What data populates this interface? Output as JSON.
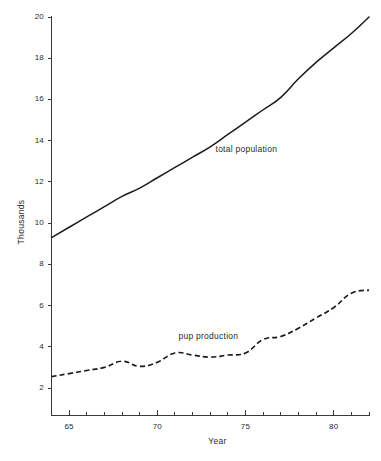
{
  "chart_data": {
    "type": "line",
    "title": "",
    "xlabel": "Year",
    "ylabel": "Thousands",
    "xlim": [
      1964,
      1982
    ],
    "ylim": [
      1.2,
      20
    ],
    "grid": false,
    "legend": "inline annotations",
    "x_tick_labels": [
      "65",
      "70",
      "75",
      "80"
    ],
    "x_tick_values": [
      1965,
      1970,
      1975,
      1980
    ],
    "x_minor_ticks": [
      1964,
      1966,
      1967,
      1968,
      1969,
      1971,
      1972,
      1973,
      1974,
      1976,
      1977,
      1978,
      1979,
      1981,
      1982
    ],
    "y_tick_labels": [
      "2",
      "4",
      "6",
      "8",
      "10",
      "12",
      "14",
      "16",
      "18",
      "20"
    ],
    "y_tick_values": [
      2,
      4,
      6,
      8,
      10,
      12,
      14,
      16,
      18,
      20
    ],
    "x": [
      1964,
      1965,
      1966,
      1967,
      1968,
      1969,
      1970,
      1971,
      1972,
      1973,
      1974,
      1975,
      1976,
      1977,
      1978,
      1979,
      1980,
      1981,
      1982
    ],
    "series": [
      {
        "name": "total population",
        "style": "solid",
        "label": "total population",
        "color": "#1b1b1b",
        "values": [
          9.3,
          9.8,
          10.3,
          10.8,
          11.3,
          11.7,
          12.2,
          12.7,
          13.2,
          13.7,
          14.3,
          14.9,
          15.5,
          16.1,
          17.0,
          17.8,
          18.5,
          19.2,
          20.0
        ]
      },
      {
        "name": "pup production",
        "style": "dashed",
        "label": "pup production",
        "color": "#1b1b1b",
        "values": [
          2.55,
          2.7,
          2.85,
          3.0,
          3.3,
          3.05,
          3.25,
          3.7,
          3.6,
          3.5,
          3.6,
          3.7,
          4.35,
          4.5,
          4.9,
          5.4,
          5.9,
          6.6,
          6.75
        ]
      }
    ],
    "annotations": [
      {
        "name": "total-population-label",
        "text": "total population",
        "x": 1973.3,
        "y": 13.6
      },
      {
        "name": "pup-production-label",
        "text": "pup production",
        "x": 1971.2,
        "y": 4.5
      }
    ]
  }
}
